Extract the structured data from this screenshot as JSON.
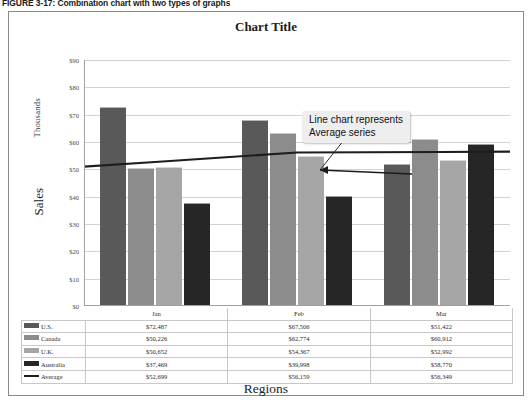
{
  "figure": {
    "caption": "FIGURE 3-17: Combination chart with two types of graphs"
  },
  "chart": {
    "title": "Chart Title",
    "x_axis_title": "Regions",
    "y_axis_title": "Sales",
    "y_axis_unit": "Thousands",
    "callout": {
      "line1": "Line chart represents",
      "line2": "Average series"
    }
  },
  "colors": {
    "us": "#595959",
    "canada": "#8c8c8c",
    "uk": "#a6a6a6",
    "australia": "#262626",
    "average_line": "#1d1d1d",
    "gridline": "#d2d2d2",
    "frame": "#8a8a8a"
  },
  "chart_data": {
    "type": "bar",
    "title": "Chart Title",
    "xlabel": "Regions",
    "ylabel": "Sales",
    "y_unit": "Thousands",
    "categories": [
      "Jan",
      "Feb",
      "Mar"
    ],
    "ylim": [
      0,
      90000
    ],
    "yticks": [
      0,
      10000,
      20000,
      30000,
      40000,
      50000,
      60000,
      70000,
      80000,
      90000
    ],
    "ytick_labels": [
      "$0",
      "$10",
      "$20",
      "$30",
      "$40",
      "$50",
      "$60",
      "$70",
      "$80",
      "$90"
    ],
    "grid": true,
    "legend": "table",
    "series": [
      {
        "name": "U.S.",
        "type": "bar",
        "values": [
          72487,
          67506,
          51422
        ],
        "labels": [
          "$72,487",
          "$67,506",
          "$51,422"
        ],
        "color": "#595959"
      },
      {
        "name": "Canada",
        "type": "bar",
        "values": [
          50226,
          62774,
          60912
        ],
        "labels": [
          "$50,226",
          "$62,774",
          "$60,912"
        ],
        "color": "#8c8c8c"
      },
      {
        "name": "U.K.",
        "type": "bar",
        "values": [
          50652,
          54367,
          52992
        ],
        "labels": [
          "$50,652",
          "$54,367",
          "$52,992"
        ],
        "color": "#a6a6a6"
      },
      {
        "name": "Australia",
        "type": "bar",
        "values": [
          37469,
          39998,
          58770
        ],
        "labels": [
          "$37,469",
          "$39,998",
          "$58,770"
        ],
        "color": "#262626"
      },
      {
        "name": "Average",
        "type": "line",
        "values": [
          52699,
          56159,
          56349
        ],
        "labels": [
          "$52,699",
          "$56,159",
          "$56,349"
        ],
        "color": "#1d1d1d"
      }
    ],
    "annotations": [
      {
        "text": "Line chart represents Average series",
        "points_to": "Average line"
      }
    ]
  },
  "table": {
    "columns": [
      "",
      "Jan",
      "Feb",
      "Mar"
    ],
    "rows": [
      {
        "label": "U.S.",
        "swatch": "#595959",
        "swatch_type": "bar",
        "values": [
          "$72,487",
          "$67,506",
          "$51,422"
        ]
      },
      {
        "label": "Canada",
        "swatch": "#8c8c8c",
        "swatch_type": "bar",
        "values": [
          "$50,226",
          "$62,774",
          "$60,912"
        ]
      },
      {
        "label": "U.K.",
        "swatch": "#a6a6a6",
        "swatch_type": "bar",
        "values": [
          "$50,652",
          "$54,367",
          "$52,992"
        ]
      },
      {
        "label": "Australia",
        "swatch": "#262626",
        "swatch_type": "bar",
        "values": [
          "$37,469",
          "$39,998",
          "$58,770"
        ]
      },
      {
        "label": "Average",
        "swatch": "#1d1d1d",
        "swatch_type": "line",
        "values": [
          "$52,699",
          "$56,159",
          "$56,349"
        ]
      }
    ]
  }
}
